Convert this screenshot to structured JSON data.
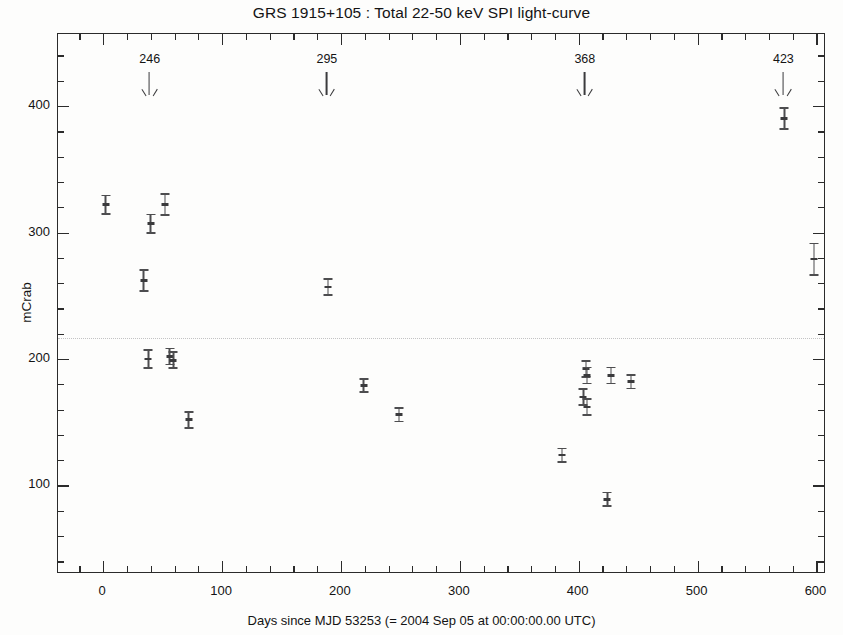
{
  "chart_data": {
    "type": "scatter",
    "title": "GRS 1915+105 : Total 22-50 keV SPI light-curve",
    "xlabel": "Days since MJD 53253 (= 2004 Sep 05 at 00:00:00.00 UTC)",
    "ylabel": "mCrab",
    "xlim": [
      -38,
      608
    ],
    "ylim": [
      30,
      457
    ],
    "xticks": [
      0,
      100,
      200,
      300,
      400,
      500,
      600
    ],
    "xticklabels": [
      "0",
      "100",
      "200",
      "300",
      "400",
      "500",
      "600"
    ],
    "yticks": [
      100,
      200,
      300,
      400
    ],
    "yticklabels": [
      "100",
      "200",
      "300",
      "400"
    ],
    "x_minor_tick_step": 20,
    "y_minor_tick_step": 20,
    "grid": false,
    "legend": null,
    "reference_line": {
      "label": "mean level",
      "y": 217,
      "style": "dotted",
      "color": "#b9b9bb"
    },
    "marker_style": "error-bar-ibeam",
    "marker_color": "#4d4d4f",
    "points": [
      {
        "x": 2,
        "y": 322,
        "yerr": 8
      },
      {
        "x": 34,
        "y": 262,
        "yerr": 9
      },
      {
        "x": 38,
        "y": 200,
        "yerr": 8
      },
      {
        "x": 40,
        "y": 307,
        "yerr": 8
      },
      {
        "x": 52,
        "y": 322,
        "yerr": 9
      },
      {
        "x": 56,
        "y": 202,
        "yerr": 7
      },
      {
        "x": 59,
        "y": 199,
        "yerr": 7
      },
      {
        "x": 72,
        "y": 152,
        "yerr": 7
      },
      {
        "x": 189,
        "y": 257,
        "yerr": 7
      },
      {
        "x": 219,
        "y": 179,
        "yerr": 6
      },
      {
        "x": 249,
        "y": 156,
        "yerr": 6
      },
      {
        "x": 386,
        "y": 124,
        "yerr": 6
      },
      {
        "x": 406,
        "y": 192,
        "yerr": 7
      },
      {
        "x": 407,
        "y": 187,
        "yerr": 7
      },
      {
        "x": 404,
        "y": 170,
        "yerr": 7
      },
      {
        "x": 407,
        "y": 162,
        "yerr": 7
      },
      {
        "x": 424,
        "y": 89,
        "yerr": 6
      },
      {
        "x": 427,
        "y": 187,
        "yerr": 7
      },
      {
        "x": 444,
        "y": 182,
        "yerr": 6
      },
      {
        "x": 573,
        "y": 390,
        "yerr": 9
      },
      {
        "x": 598,
        "y": 279,
        "yerr": 13
      }
    ],
    "annotations": [
      {
        "label": "246",
        "x": 40,
        "kind": "down-arrow"
      },
      {
        "label": "295",
        "x": 189,
        "kind": "down-arrow"
      },
      {
        "label": "368",
        "x": 406,
        "kind": "down-arrow"
      },
      {
        "label": "423",
        "x": 573,
        "kind": "down-arrow"
      }
    ]
  }
}
